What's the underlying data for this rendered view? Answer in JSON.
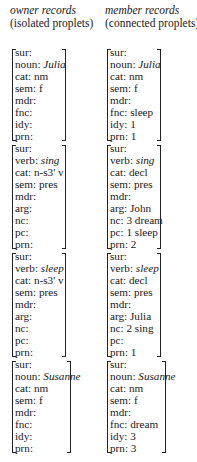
{
  "columns": [
    {
      "title": "owner records",
      "subtitle": "(isolated proplets)",
      "records": [
        {
          "width": "w1",
          "lines": [
            {
              "k": "sur:",
              "v": ""
            },
            {
              "k": "noun: ",
              "v": "Julia",
              "italic": true
            },
            {
              "k": "cat: nm",
              "v": ""
            },
            {
              "k": "sem: f",
              "v": ""
            },
            {
              "k": "mdr:",
              "v": ""
            },
            {
              "k": "fnc:",
              "v": ""
            },
            {
              "k": "idy:",
              "v": ""
            },
            {
              "k": "prn:",
              "v": ""
            }
          ]
        },
        {
          "width": "w1",
          "lines": [
            {
              "k": "sur:",
              "v": ""
            },
            {
              "k": "verb: ",
              "v": "sing",
              "italic": true
            },
            {
              "k": "cat: n-s3' v",
              "v": ""
            },
            {
              "k": "sem: pres",
              "v": ""
            },
            {
              "k": "mdr:",
              "v": ""
            },
            {
              "k": "arg:",
              "v": ""
            },
            {
              "k": "nc:",
              "v": ""
            },
            {
              "k": "pc:",
              "v": ""
            },
            {
              "k": "prn:",
              "v": ""
            }
          ]
        },
        {
          "width": "w1",
          "lines": [
            {
              "k": "sur:",
              "v": ""
            },
            {
              "k": "verb: ",
              "v": "sleep",
              "italic": true
            },
            {
              "k": "cat: n-s3' v",
              "v": ""
            },
            {
              "k": "sem: pres",
              "v": ""
            },
            {
              "k": "mdr:",
              "v": ""
            },
            {
              "k": "arg:",
              "v": ""
            },
            {
              "k": "nc:",
              "v": ""
            },
            {
              "k": "pc:",
              "v": ""
            },
            {
              "k": "prn:",
              "v": ""
            }
          ]
        },
        {
          "width": "w2",
          "lines": [
            {
              "k": "sur:",
              "v": ""
            },
            {
              "k": "noun: ",
              "v": "Susanne",
              "italic": true
            },
            {
              "k": "cat: nm",
              "v": ""
            },
            {
              "k": "sem: f",
              "v": ""
            },
            {
              "k": "mdr:",
              "v": ""
            },
            {
              "k": "fnc:",
              "v": ""
            },
            {
              "k": "idy:",
              "v": ""
            },
            {
              "k": "prn:",
              "v": ""
            }
          ]
        }
      ]
    },
    {
      "title": "member records",
      "subtitle": "(connected proplets)",
      "records": [
        {
          "width": "w1",
          "lines": [
            {
              "k": "sur:",
              "v": ""
            },
            {
              "k": "noun: ",
              "v": "Julia",
              "italic": true
            },
            {
              "k": "cat: nm",
              "v": ""
            },
            {
              "k": "sem: f",
              "v": ""
            },
            {
              "k": "mdr:",
              "v": ""
            },
            {
              "k": "fnc: sleep",
              "v": ""
            },
            {
              "k": "idy: 1",
              "v": ""
            },
            {
              "k": "prn: 1",
              "v": ""
            }
          ]
        },
        {
          "width": "w1",
          "lines": [
            {
              "k": "sur:",
              "v": ""
            },
            {
              "k": "verb: ",
              "v": "sing",
              "italic": true
            },
            {
              "k": "cat: decl",
              "v": ""
            },
            {
              "k": "sem: pres",
              "v": ""
            },
            {
              "k": "mdr:",
              "v": ""
            },
            {
              "k": "arg: John",
              "v": ""
            },
            {
              "k": "nc: 3 dream",
              "v": ""
            },
            {
              "k": "pc: 1 sleep",
              "v": ""
            },
            {
              "k": "prn: 2",
              "v": ""
            }
          ]
        },
        {
          "width": "w1",
          "lines": [
            {
              "k": "sur:",
              "v": ""
            },
            {
              "k": "verb: ",
              "v": "sleep",
              "italic": true
            },
            {
              "k": "cat: decl",
              "v": ""
            },
            {
              "k": "sem: pres",
              "v": ""
            },
            {
              "k": "mdr:",
              "v": ""
            },
            {
              "k": "arg: Julia",
              "v": ""
            },
            {
              "k": "nc: 2 sing",
              "v": ""
            },
            {
              "k": "pc:",
              "v": ""
            },
            {
              "k": "prn: 1",
              "v": ""
            }
          ]
        },
        {
          "width": "w2",
          "lines": [
            {
              "k": "sur:",
              "v": ""
            },
            {
              "k": "noun: ",
              "v": "Susanne",
              "italic": true
            },
            {
              "k": "cat: nm",
              "v": ""
            },
            {
              "k": "sem: f",
              "v": ""
            },
            {
              "k": "mdr:",
              "v": ""
            },
            {
              "k": "fnc: dream",
              "v": ""
            },
            {
              "k": "idy: 3",
              "v": ""
            },
            {
              "k": "prn: 3",
              "v": ""
            }
          ]
        }
      ]
    }
  ]
}
